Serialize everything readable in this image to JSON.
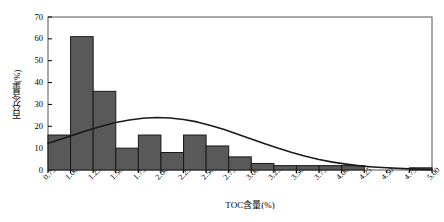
{
  "chart_data": {
    "type": "bar",
    "title": "",
    "subtitle": "",
    "xlabel": "TOC含量(%)",
    "ylabel": "百分含量(%)",
    "xlim": [
      0.75,
      5.0
    ],
    "ylim": [
      0,
      70
    ],
    "y_ticks": [
      0,
      10,
      20,
      30,
      40,
      50,
      60,
      70
    ],
    "x_ticks": [
      "0.75",
      "1.00",
      "1.25",
      "1.50",
      "1.75",
      "2.00",
      "2.25",
      "2.50",
      "2.75",
      "3.00",
      "3.25",
      "3.50",
      "3.75",
      "4.00",
      "4.25",
      "4.50",
      "4.75",
      "5.00"
    ],
    "bin_width": 0.25,
    "grid": false,
    "legend": null,
    "bar_color": "#595959",
    "bar_edge_color": "#1a1a1a",
    "curve_color": "#1a1a1a",
    "categories": [
      "0.75-1.00",
      "1.00-1.25",
      "1.25-1.50",
      "1.50-1.75",
      "1.75-2.00",
      "2.00-2.25",
      "2.25-2.50",
      "2.50-2.75",
      "2.75-3.00",
      "3.00-3.25",
      "3.25-3.50",
      "3.50-3.75",
      "3.75-4.00",
      "4.00-4.25",
      "4.25-4.50",
      "4.50-4.75",
      "4.75-5.00"
    ],
    "bin_starts": [
      0.75,
      1.0,
      1.25,
      1.5,
      1.75,
      2.0,
      2.25,
      2.5,
      2.75,
      3.0,
      3.25,
      3.5,
      3.75,
      4.0,
      4.25,
      4.5,
      4.75
    ],
    "values": [
      16,
      61,
      36,
      10,
      16,
      8,
      16,
      11,
      6,
      3,
      2,
      2,
      2,
      2,
      0,
      0,
      1
    ],
    "series": [
      {
        "name": "百分含量",
        "type": "bar",
        "values": [
          16,
          61,
          36,
          10,
          16,
          8,
          16,
          11,
          6,
          3,
          2,
          2,
          2,
          2,
          0,
          0,
          1
        ]
      },
      {
        "name": "正态分布拟合曲线",
        "type": "line",
        "x": [
          0.75,
          0.9,
          1.05,
          1.2,
          1.35,
          1.5,
          1.65,
          1.8,
          1.95,
          2.1,
          2.25,
          2.4,
          2.55,
          2.7,
          2.85,
          3.0,
          3.15,
          3.3,
          3.45,
          3.6,
          3.75,
          3.9,
          4.05,
          4.2,
          4.35,
          4.5,
          4.75,
          5.0
        ],
        "values": [
          12.2,
          14.2,
          16.3,
          18.3,
          20.1,
          21.7,
          22.9,
          23.7,
          24.0,
          23.8,
          23.1,
          22.0,
          20.4,
          18.5,
          16.4,
          14.2,
          12.0,
          9.9,
          8.0,
          6.3,
          4.8,
          3.6,
          2.7,
          1.9,
          1.4,
          1.0,
          0.5,
          0.2
        ]
      }
    ]
  }
}
